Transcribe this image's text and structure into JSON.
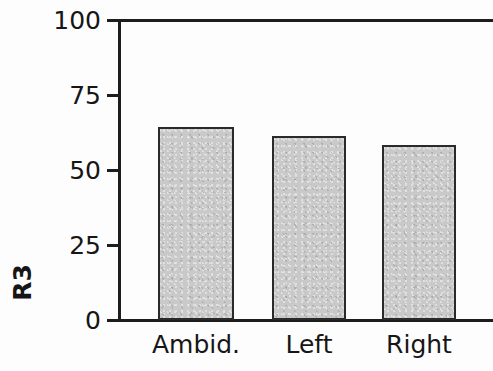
{
  "chart_data": {
    "type": "bar",
    "title": "",
    "subtitle": "",
    "xlabel": "",
    "ylabel": "R3",
    "categories": [
      "Ambid.",
      "Left",
      "Right"
    ],
    "values": [
      64,
      61,
      58
    ],
    "series": [
      {
        "name": "R3",
        "values": [
          64,
          61,
          58
        ]
      }
    ],
    "ylim": [
      0,
      100
    ],
    "yticks": [
      0,
      25,
      50,
      75,
      100
    ],
    "ytick_labels": [
      "0",
      "25",
      "50",
      "75",
      "100"
    ],
    "grid": false,
    "legend": null,
    "annotations": [],
    "bar_fill_color": "#c9c9c9",
    "bar_edge_color": "#2a2a2a",
    "axis_color": "#1d1d1d",
    "text_color": "#161616",
    "background_color": "#fdfdfd"
  }
}
